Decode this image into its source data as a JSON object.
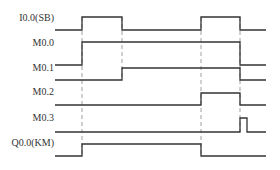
{
  "diagram": {
    "type": "timing-diagram",
    "line_color": "#333333",
    "guide_color": "#888888",
    "signals": [
      {
        "name": "I0.0(SB)",
        "label_top": 12,
        "low_y": 30,
        "high_y": 17,
        "segments": [
          [
            55,
            82,
            0
          ],
          [
            82,
            122,
            1
          ],
          [
            122,
            201,
            0
          ],
          [
            201,
            240,
            1
          ],
          [
            240,
            266,
            0
          ]
        ]
      },
      {
        "name": "M0.0",
        "label_top": 37,
        "low_y": 65,
        "high_y": 42,
        "segments": [
          [
            55,
            82,
            0
          ],
          [
            82,
            240,
            1
          ],
          [
            240,
            266,
            0
          ]
        ]
      },
      {
        "name": "M0.1",
        "label_top": 62,
        "low_y": 80,
        "high_y": 68,
        "segments": [
          [
            55,
            122,
            0
          ],
          [
            122,
            240,
            1
          ],
          [
            240,
            266,
            0
          ]
        ]
      },
      {
        "name": "M0.2",
        "label_top": 96,
        "low_y": 105,
        "high_y": 93,
        "segments": [
          [
            55,
            201,
            0
          ],
          [
            201,
            240,
            1
          ],
          [
            240,
            266,
            0
          ]
        ]
      },
      {
        "name": "M0.3",
        "label_top": 122,
        "low_y": 132,
        "high_y": 118,
        "segments": [
          [
            55,
            240,
            0
          ],
          [
            240,
            247,
            1
          ],
          [
            247,
            266,
            0
          ]
        ]
      },
      {
        "name": "Q0.0(KM)",
        "label_top": 145,
        "low_y": 156,
        "high_y": 144,
        "segments": [
          [
            55,
            82,
            0
          ],
          [
            82,
            201,
            1
          ],
          [
            201,
            266,
            0
          ]
        ]
      }
    ],
    "guides": [
      {
        "x": 82,
        "y1": 17,
        "y2": 156
      },
      {
        "x": 122,
        "y1": 17,
        "y2": 80
      },
      {
        "x": 201,
        "y1": 17,
        "y2": 156
      },
      {
        "x": 240,
        "y1": 17,
        "y2": 132
      }
    ]
  }
}
